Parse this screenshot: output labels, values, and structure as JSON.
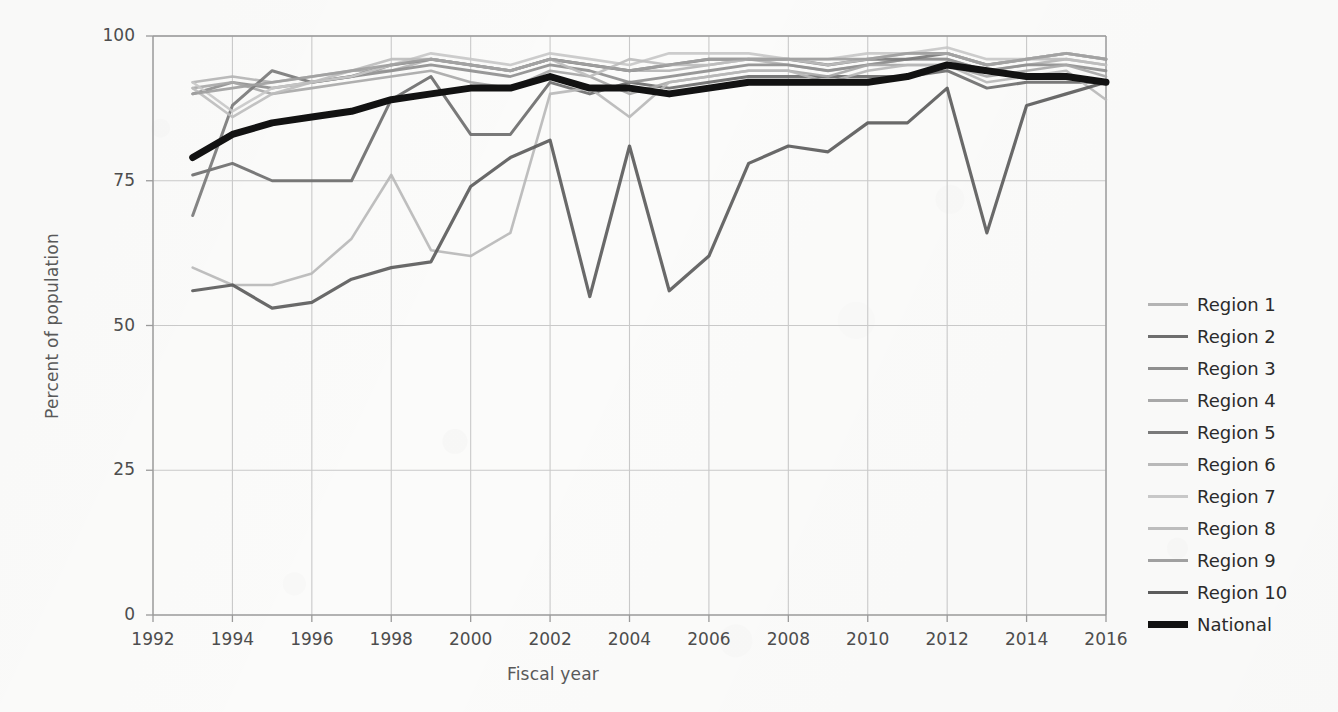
{
  "chart_data": {
    "type": "line",
    "title": "",
    "xlabel": "Fiscal year",
    "ylabel": "Percent of population",
    "xlim": [
      1992,
      2016
    ],
    "ylim": [
      0,
      100
    ],
    "grid": true,
    "legend_position": "right",
    "x_ticks": [
      1992,
      1994,
      1996,
      1998,
      2000,
      2002,
      2004,
      2006,
      2008,
      2010,
      2012,
      2014,
      2016
    ],
    "y_ticks": [
      0,
      25,
      50,
      75,
      100
    ],
    "x": [
      1993,
      1994,
      1995,
      1996,
      1997,
      1998,
      1999,
      2000,
      2001,
      2002,
      2003,
      2004,
      2005,
      2006,
      2007,
      2008,
      2009,
      2010,
      2011,
      2012,
      2013,
      2014,
      2015,
      2016
    ],
    "series": [
      {
        "name": "Region 1",
        "color": "#b4b4b4",
        "width": 2.6,
        "values": [
          92,
          93,
          92,
          93,
          94,
          94,
          96,
          95,
          94,
          96,
          95,
          94,
          94,
          95,
          96,
          95,
          94,
          95,
          96,
          96,
          94,
          95,
          96,
          95
        ]
      },
      {
        "name": "Region 2",
        "color": "#6e6e6e",
        "width": 3.0,
        "values": [
          76,
          78,
          75,
          75,
          75,
          89,
          93,
          83,
          83,
          92,
          90,
          92,
          91,
          92,
          93,
          93,
          93,
          93,
          93,
          94,
          91,
          92,
          92,
          92
        ]
      },
      {
        "name": "Region 3",
        "color": "#8f8f8f",
        "width": 2.8,
        "values": [
          90,
          92,
          91,
          92,
          93,
          94,
          95,
          94,
          93,
          95,
          94,
          92,
          93,
          94,
          95,
          95,
          94,
          95,
          96,
          96,
          94,
          95,
          95,
          94
        ]
      },
      {
        "name": "Region 4",
        "color": "#a8a8a8",
        "width": 2.6,
        "values": [
          91,
          92,
          90,
          91,
          92,
          93,
          94,
          92,
          91,
          94,
          93,
          90,
          92,
          93,
          94,
          94,
          93,
          95,
          95,
          95,
          93,
          94,
          95,
          93
        ]
      },
      {
        "name": "Region 5",
        "color": "#7a7a7a",
        "width": 3.0,
        "values": [
          69,
          88,
          94,
          92,
          93,
          95,
          96,
          95,
          94,
          96,
          95,
          94,
          95,
          96,
          96,
          96,
          95,
          96,
          96,
          97,
          95,
          96,
          97,
          96
        ]
      },
      {
        "name": "Region 6",
        "color": "#b9b9b9",
        "width": 2.6,
        "values": [
          60,
          57,
          57,
          59,
          65,
          76,
          63,
          62,
          66,
          90,
          91,
          86,
          92,
          93,
          94,
          94,
          92,
          94,
          95,
          95,
          92,
          93,
          94,
          89
        ]
      },
      {
        "name": "Region 7",
        "color": "#c8c8c8",
        "width": 2.6,
        "values": [
          92,
          87,
          91,
          92,
          93,
          95,
          97,
          96,
          95,
          97,
          96,
          95,
          97,
          97,
          97,
          96,
          96,
          97,
          97,
          98,
          96,
          96,
          97,
          96
        ]
      },
      {
        "name": "Region 8",
        "color": "#bdbdbd",
        "width": 2.6,
        "values": [
          91,
          86,
          90,
          92,
          94,
          96,
          96,
          95,
          94,
          96,
          93,
          96,
          95,
          95,
          96,
          96,
          95,
          96,
          97,
          97,
          95,
          96,
          96,
          95
        ]
      },
      {
        "name": "Region 9",
        "color": "#a0a0a0",
        "width": 2.8,
        "values": [
          90,
          91,
          92,
          93,
          94,
          95,
          96,
          95,
          94,
          96,
          95,
          94,
          95,
          96,
          96,
          96,
          96,
          96,
          97,
          97,
          95,
          96,
          97,
          96
        ]
      },
      {
        "name": "Region 10",
        "color": "#5c5c5c",
        "width": 3.2,
        "values": [
          56,
          57,
          53,
          54,
          58,
          60,
          61,
          74,
          79,
          82,
          55,
          81,
          56,
          62,
          78,
          81,
          80,
          85,
          85,
          91,
          66,
          88,
          90,
          92
        ]
      },
      {
        "name": "National",
        "color": "#121212",
        "width": 7.0,
        "values": [
          79,
          83,
          85,
          86,
          87,
          89,
          90,
          91,
          91,
          93,
          91,
          91,
          90,
          91,
          92,
          92,
          92,
          92,
          93,
          95,
          94,
          93,
          93,
          92
        ]
      }
    ]
  },
  "legend": {
    "items": [
      {
        "label": "Region 1"
      },
      {
        "label": "Region 2"
      },
      {
        "label": "Region 3"
      },
      {
        "label": "Region 4"
      },
      {
        "label": "Region 5"
      },
      {
        "label": "Region 6"
      },
      {
        "label": "Region 7"
      },
      {
        "label": "Region 8"
      },
      {
        "label": "Region 9"
      },
      {
        "label": "Region 10"
      },
      {
        "label": "National"
      }
    ]
  },
  "theme": {
    "background": "#fbfbfa",
    "grid_color": "#c9c9c9",
    "axis_color": "#9a9a9a",
    "tick_text_color": "#4d4d4d",
    "title_text_color": "#595959"
  }
}
